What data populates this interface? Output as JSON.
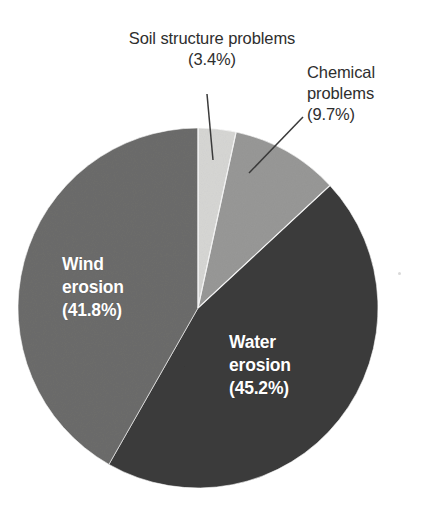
{
  "figure": {
    "background_color": "#ffffff",
    "geometry": {
      "center_x": 198,
      "center_y": 308,
      "radius": 180
    }
  },
  "chart_data": {
    "type": "pie",
    "title": "",
    "subtitle": "",
    "xlabel": "",
    "ylabel": "",
    "grid": false,
    "legend_position": "none",
    "units": "percent",
    "start_angle_deg": 0,
    "direction": "clockwise",
    "categories": [
      "Soil structure problems",
      "Chemical problems",
      "Water erosion",
      "Wind erosion"
    ],
    "values": [
      3.4,
      9.7,
      45.2,
      41.8
    ],
    "colors": [
      "#d6d6d4",
      "#989897",
      "#3b3b3b",
      "#6c6c6b"
    ],
    "slices": [
      {
        "name": "Soil structure problems",
        "value": 3.4,
        "value_text": "(3.4%)",
        "color": "#d6d6d4",
        "label_lines": [
          "Soil structure problems",
          "(3.4%)"
        ],
        "label_placement": "outside",
        "leader_line": true
      },
      {
        "name": "Chemical problems",
        "value": 9.7,
        "value_text": "(9.7%)",
        "color": "#989897",
        "label_lines": [
          "Chemical",
          "problems",
          "(9.7%)"
        ],
        "label_placement": "outside",
        "leader_line": true
      },
      {
        "name": "Water erosion",
        "value": 45.2,
        "value_text": "(45.2%)",
        "color": "#3b3b3b",
        "label_lines": [
          "Water",
          "erosion",
          "(45.2%)"
        ],
        "label_placement": "inside",
        "label_color": "#ffffff",
        "leader_line": false
      },
      {
        "name": "Wind erosion",
        "value": 41.8,
        "value_text": "(41.8%)",
        "color": "#6c6c6b",
        "label_lines": [
          "Wind",
          "erosion",
          "(41.8%)"
        ],
        "label_placement": "inside",
        "label_color": "#ffffff",
        "leader_line": false
      }
    ]
  },
  "labels": {
    "soil": {
      "line1": "Soil structure problems",
      "line2": "(3.4%)"
    },
    "chemical": {
      "line1": "Chemical",
      "line2": "problems",
      "line3": "(9.7%)"
    },
    "water": {
      "line1": "Water",
      "line2": "erosion",
      "line3": "(45.2%)"
    },
    "wind": {
      "line1": "Wind",
      "line2": "erosion",
      "line3": "(41.8%)"
    }
  }
}
